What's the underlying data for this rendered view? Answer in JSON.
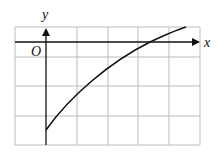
{
  "diagram": {
    "axis_labels": {
      "x": "x",
      "y": "y",
      "origin": "O"
    },
    "grid": {
      "columns_x": [
        15,
        46,
        77,
        108,
        138,
        169,
        200
      ],
      "rows_y": [
        27,
        57,
        86,
        116,
        145
      ],
      "color": "#bbbbbb"
    },
    "axes": {
      "x_axis_y": 42,
      "y_axis_x": 46,
      "color": "#111111"
    },
    "curve": {
      "description": "increasing concave curve starting on negative y-axis, crossing x-axis, rising to top edge",
      "color": "#111111",
      "path": "M46,130 C70,96 110,62 150,42 C165,35 176,30 186,27"
    }
  }
}
